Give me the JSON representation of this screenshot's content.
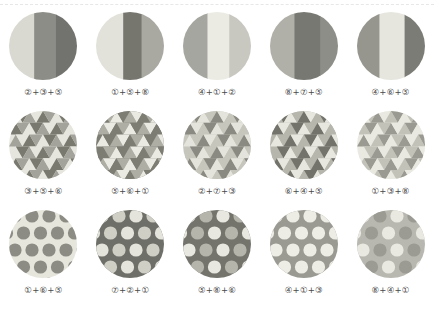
{
  "page": {
    "background": "#ffffff",
    "label_color": "#4a4a4a",
    "divider": "dashed-rule"
  },
  "palette": {
    "p1": "#dcdcd4",
    "p2": "#c9c9c0",
    "p3": "#e8e8e1",
    "p4": "#9a9a94",
    "p5": "#7d7d78",
    "p6": "#b4b4ac",
    "p7": "#6e6e6a",
    "p8": "#8b8b86"
  },
  "rows": [
    {
      "pattern": "vertical-stripes",
      "cells": [
        {
          "label": "②+③+⑤",
          "codes": [
            2,
            3,
            5
          ],
          "bands": [
            {
              "width": 0.37,
              "color": "#d9d9d2"
            },
            {
              "width": 0.32,
              "color": "#8d8d88"
            },
            {
              "width": 0.31,
              "color": "#72726e"
            }
          ]
        },
        {
          "label": "①+⑤+⑧",
          "codes": [
            1,
            5,
            8
          ],
          "bands": [
            {
              "width": 0.4,
              "color": "#e2e2db"
            },
            {
              "width": 0.27,
              "color": "#76766f"
            },
            {
              "width": 0.33,
              "color": "#a9a9a2"
            }
          ]
        },
        {
          "label": "④+①+②",
          "codes": [
            4,
            1,
            2
          ],
          "bands": [
            {
              "width": 0.36,
              "color": "#a6a6a0"
            },
            {
              "width": 0.32,
              "color": "#ebebe4"
            },
            {
              "width": 0.32,
              "color": "#c8c8c0"
            }
          ]
        },
        {
          "label": "⑧+⑦+⑤",
          "codes": [
            8,
            7,
            5
          ],
          "bands": [
            {
              "width": 0.36,
              "color": "#b0b0a8"
            },
            {
              "width": 0.38,
              "color": "#787873"
            },
            {
              "width": 0.26,
              "color": "#8e8e89"
            }
          ]
        },
        {
          "label": "④+⑥+⑤",
          "codes": [
            4,
            6,
            5
          ],
          "bands": [
            {
              "width": 0.33,
              "color": "#96968f"
            },
            {
              "width": 0.37,
              "color": "#e6e6df"
            },
            {
              "width": 0.3,
              "color": "#7c7c77"
            }
          ]
        }
      ]
    },
    {
      "pattern": "triangles",
      "cells": [
        {
          "label": "③+⑤+⑥",
          "codes": [
            3,
            5,
            6
          ],
          "colors": [
            "#e6e6df",
            "#79796f",
            "#a3a39b"
          ]
        },
        {
          "label": "⑤+⑥+①",
          "codes": [
            5,
            6,
            1
          ],
          "colors": [
            "#7d7d74",
            "#aeaea5",
            "#eaeae3"
          ]
        },
        {
          "label": "②+⑦+③",
          "codes": [
            2,
            7,
            3
          ],
          "colors": [
            "#c6c6bd",
            "#8a8a82",
            "#e4e4dc"
          ]
        },
        {
          "label": "⑥+④+⑤",
          "codes": [
            6,
            4,
            5
          ],
          "colors": [
            "#b6b6ad",
            "#73736c",
            "#e7e7e0"
          ]
        },
        {
          "label": "①+③+⑧",
          "codes": [
            1,
            3,
            8
          ],
          "colors": [
            "#e9e9e2",
            "#c2c2b9",
            "#9a9a92"
          ]
        }
      ]
    },
    {
      "pattern": "polka-dots",
      "cells": [
        {
          "label": "①+⑥+⑤",
          "codes": [
            1,
            6,
            5
          ],
          "background": "#e6e6dd",
          "dot_colors": [
            "#8c8c85",
            "#8c8c85"
          ]
        },
        {
          "label": "⑦+②+①",
          "codes": [
            7,
            2,
            1
          ],
          "background": "#6f6f69",
          "dot_colors": [
            "#e4e4dc",
            "#cfcfc6"
          ]
        },
        {
          "label": "⑤+⑧+⑥",
          "codes": [
            5,
            8,
            6
          ],
          "background": "#74746d",
          "dot_colors": [
            "#e8e8e0",
            "#b5b5ac"
          ]
        },
        {
          "label": "④+①+③",
          "codes": [
            4,
            1,
            3
          ],
          "background": "#9a9a93",
          "dot_colors": [
            "#ededE5",
            "#ededE5"
          ]
        },
        {
          "label": "⑧+④+①",
          "codes": [
            8,
            4,
            1
          ],
          "background": "#b8b8b0",
          "dot_colors": [
            "#e9e9e1",
            "#9b9b93"
          ]
        }
      ]
    }
  ]
}
